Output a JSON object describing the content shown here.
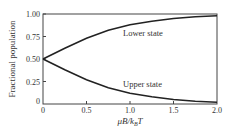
{
  "chart_data": {
    "type": "line",
    "title": "",
    "xlabel": "μB/k_BT",
    "ylabel": "Fractional population",
    "xlim": [
      0,
      2.0
    ],
    "ylim": [
      0,
      1.0
    ],
    "grid": false,
    "legend": "none (inline annotations)",
    "x_ticks": [
      "0",
      "0.5",
      "1.0",
      "1.5",
      "2.0"
    ],
    "y_ticks": [
      "0",
      "0.25",
      "0.50",
      "0.75",
      "1.00"
    ],
    "x": [
      0,
      0.25,
      0.5,
      0.75,
      1.0,
      1.25,
      1.5,
      1.75,
      2.0
    ],
    "series": [
      {
        "name": "Lower state",
        "values": [
          0.5,
          0.62,
          0.73,
          0.82,
          0.88,
          0.92,
          0.95,
          0.97,
          0.98
        ]
      },
      {
        "name": "Upper state",
        "values": [
          0.5,
          0.38,
          0.27,
          0.18,
          0.12,
          0.08,
          0.05,
          0.03,
          0.02
        ]
      }
    ],
    "annotations": [
      {
        "text": "Lower state",
        "x": 1.0,
        "y": 0.8
      },
      {
        "text": "Upper state",
        "x": 1.0,
        "y": 0.17
      }
    ]
  },
  "labels": {
    "ylabel": "Fractional population",
    "xlabel_main": "μB/k",
    "xlabel_sub": "B",
    "xlabel_tail": "T",
    "lower": "Lower state",
    "upper": "Upper state",
    "xt0": "0",
    "xt1": "0.5",
    "xt2": "1.0",
    "xt3": "1.5",
    "xt4": "2.0",
    "yt0": "0",
    "yt1": "0.25",
    "yt2": "0.50",
    "yt3": "0.75",
    "yt4": "1.00"
  }
}
